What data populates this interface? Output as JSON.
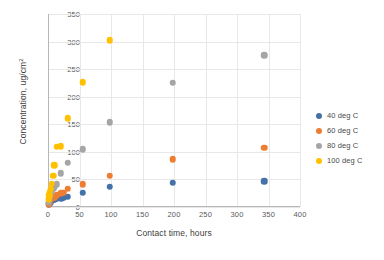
{
  "chart_data": {
    "type": "scatter",
    "title": "",
    "xlabel": "Contact time, hours",
    "ylabel": "Concentration, ug/cm",
    "ylabel_sup": "2",
    "xlim": [
      0,
      400
    ],
    "ylim": [
      0,
      350
    ],
    "xticks": [
      0,
      50,
      100,
      150,
      200,
      250,
      300,
      350,
      400
    ],
    "yticks": [
      0,
      50,
      100,
      150,
      200,
      250,
      300,
      350
    ],
    "grid": true,
    "legend_position": "right",
    "series": [
      {
        "name": "40 deg C",
        "color": "#4472A8",
        "points": [
          [
            1,
            4
          ],
          [
            2,
            6
          ],
          [
            3,
            8
          ],
          [
            4,
            9
          ],
          [
            6,
            11
          ],
          [
            8,
            13
          ],
          [
            10,
            14
          ],
          [
            14,
            15
          ],
          [
            21,
            16
          ],
          [
            24,
            17
          ],
          [
            31,
            19
          ],
          [
            55,
            26
          ],
          [
            98,
            37
          ],
          [
            198,
            44
          ],
          [
            343,
            47
          ]
        ]
      },
      {
        "name": "60 deg C",
        "color": "#ED7D31",
        "points": [
          [
            1,
            5
          ],
          [
            2,
            9
          ],
          [
            3,
            12
          ],
          [
            4,
            14
          ],
          [
            6,
            16
          ],
          [
            8,
            18
          ],
          [
            10,
            18
          ],
          [
            14,
            21
          ],
          [
            20,
            25
          ],
          [
            24,
            26
          ],
          [
            31,
            33
          ],
          [
            55,
            41
          ],
          [
            98,
            57
          ],
          [
            198,
            87
          ],
          [
            343,
            107
          ]
        ]
      },
      {
        "name": "80 deg C",
        "color": "#A5A5A5",
        "points": [
          [
            1,
            9
          ],
          [
            2,
            15
          ],
          [
            3,
            20
          ],
          [
            4,
            24
          ],
          [
            6,
            28
          ],
          [
            8,
            33
          ],
          [
            10,
            37
          ],
          [
            14,
            41
          ],
          [
            20,
            61
          ],
          [
            31,
            80
          ],
          [
            55,
            105
          ],
          [
            98,
            154
          ],
          [
            198,
            225
          ],
          [
            343,
            275
          ]
        ]
      },
      {
        "name": "100 deg C",
        "color": "#FFC000",
        "points": [
          [
            1,
            14
          ],
          [
            2,
            21
          ],
          [
            3,
            28
          ],
          [
            4,
            33
          ],
          [
            6,
            42
          ],
          [
            8,
            57
          ],
          [
            10,
            76
          ],
          [
            14,
            109
          ],
          [
            20,
            110
          ],
          [
            31,
            161
          ],
          [
            55,
            226
          ],
          [
            98,
            302
          ]
        ]
      }
    ]
  }
}
